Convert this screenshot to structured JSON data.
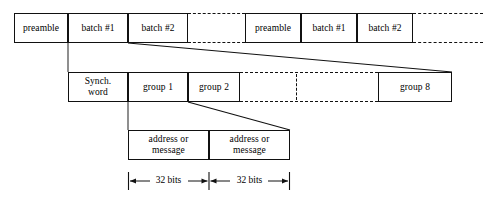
{
  "figure": {
    "line_color": "#111111",
    "background": "#ffffff"
  },
  "rows": {
    "batches": {
      "label": "batch-row",
      "cells": [
        {
          "text": "preamble",
          "x": 14,
          "y": 13,
          "w": 54,
          "h": 30
        },
        {
          "text": "batch #1",
          "x": 68,
          "y": 13,
          "w": 60,
          "h": 30
        },
        {
          "text": "batch #2",
          "x": 128,
          "y": 13,
          "w": 60,
          "h": 30
        },
        {
          "text": "preamble",
          "x": 245,
          "y": 13,
          "w": 56,
          "h": 30
        },
        {
          "text": "batch #1",
          "x": 301,
          "y": 13,
          "w": 56,
          "h": 30
        },
        {
          "text": "batch #2",
          "x": 357,
          "y": 13,
          "w": 56,
          "h": 30
        }
      ],
      "dashes": [
        {
          "x": 188,
          "y": 13,
          "w": 57,
          "h": 30
        },
        {
          "x": 413,
          "y": 13,
          "w": 70,
          "h": 30
        }
      ]
    },
    "groups": {
      "label": "group-row",
      "cells": [
        {
          "text": "Synch.\nword",
          "x": 68,
          "y": 72,
          "w": 60,
          "h": 30
        },
        {
          "text": "group 1",
          "x": 128,
          "y": 72,
          "w": 60,
          "h": 30
        },
        {
          "text": "group 2",
          "x": 188,
          "y": 72,
          "w": 52,
          "h": 30
        },
        {
          "text": "group 8",
          "x": 378,
          "y": 72,
          "w": 74,
          "h": 30
        }
      ],
      "dashes": [
        {
          "x": 240,
          "y": 72,
          "w": 138,
          "h": 30
        }
      ],
      "divider": {
        "x": 296,
        "y": 74,
        "h": 26
      }
    },
    "codewords": {
      "label": "codeword-row",
      "cells": [
        {
          "text": "address or\nmessage",
          "x": 128,
          "y": 130,
          "w": 81,
          "h": 30
        },
        {
          "text": "address or\nmessage",
          "x": 209,
          "y": 130,
          "w": 81,
          "h": 30
        }
      ]
    }
  },
  "connectors": [
    {
      "name": "batch2-to-group-row",
      "x1": 128,
      "y1": 43,
      "x2": 452,
      "y2": 72
    },
    {
      "name": "group1-to-codeword-row",
      "x1": 188,
      "y1": 102,
      "x2": 290,
      "y2": 130
    },
    {
      "name": "preamble-drop",
      "x1": 68,
      "y1": 43,
      "x2": 68,
      "y2": 72
    },
    {
      "name": "group1-drop",
      "x1": 128,
      "y1": 102,
      "x2": 128,
      "y2": 130
    }
  ],
  "dimensions": {
    "label": "bit-width-annotations",
    "items": [
      {
        "text": "32 bits",
        "x": 128,
        "y": 178,
        "w": 81
      },
      {
        "text": "32 bits",
        "x": 209,
        "y": 178,
        "w": 81
      }
    ],
    "tick_height": 12
  }
}
